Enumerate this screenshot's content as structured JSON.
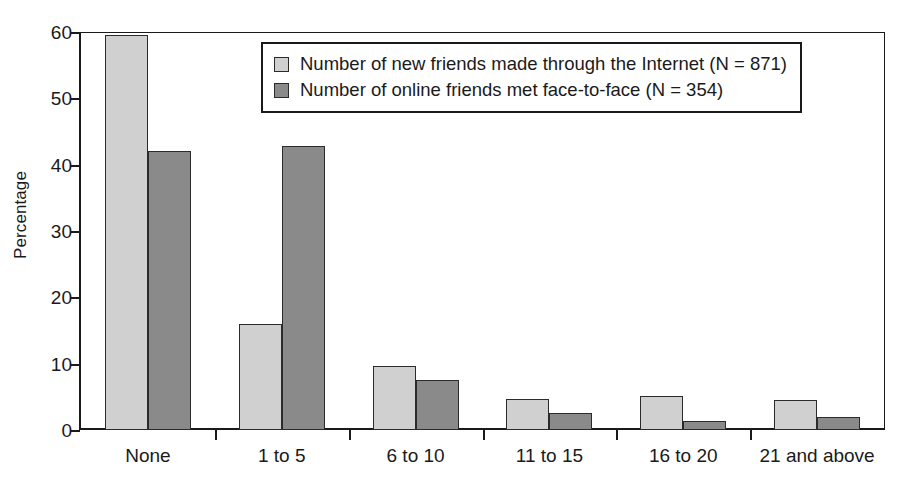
{
  "chart_data": {
    "type": "bar",
    "title": "",
    "xlabel": "",
    "ylabel": "Percentage",
    "ylim": [
      0,
      60
    ],
    "yticks": [
      0,
      10,
      20,
      30,
      40,
      50,
      60
    ],
    "ytick_labels": [
      "0",
      "10",
      "20",
      "30",
      "40",
      "50",
      "60"
    ],
    "grid": false,
    "legend_position": "top-center",
    "categories": [
      "None",
      "1 to 5",
      "6 to 10",
      "11 to 15",
      "16 to 20",
      "21 and above"
    ],
    "series": [
      {
        "name": "Number of new friends made through the Internet (N = 871)",
        "color": "#d0d0d0",
        "values": [
          59.5,
          16.0,
          9.6,
          4.7,
          5.1,
          4.6
        ]
      },
      {
        "name": "Number of online friends met face-to-face (N = 354)",
        "color": "#8a8a8a",
        "values": [
          42.0,
          42.8,
          7.6,
          2.5,
          1.3,
          2.0
        ]
      }
    ]
  },
  "legend": {
    "entries": [
      {
        "label": "Number of new friends made through the Internet (N = 871)"
      },
      {
        "label": "Number of online friends met face-to-face (N = 354)"
      }
    ]
  },
  "axes": {
    "y_title": "Percentage"
  },
  "colors": {
    "series_light": "#d0d0d0",
    "series_dark": "#8a8a8a",
    "axis": "#1a1a1a",
    "background": "#ffffff"
  }
}
